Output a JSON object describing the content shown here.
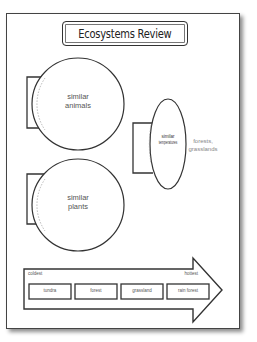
{
  "title": "Ecosystems Review",
  "circles": [
    {
      "line1": "similar",
      "line2": "animals"
    },
    {
      "line1": "similar",
      "line2": "plants"
    }
  ],
  "ellipse": {
    "line1": "similar",
    "line2": "temperatures"
  },
  "side_note": {
    "line1": "forests,",
    "line2": "grasslands"
  },
  "arrow": {
    "left_label": "coldest",
    "right_label": "hottest",
    "boxes": [
      "tundra",
      "forest",
      "grassland",
      "rain forest"
    ]
  }
}
